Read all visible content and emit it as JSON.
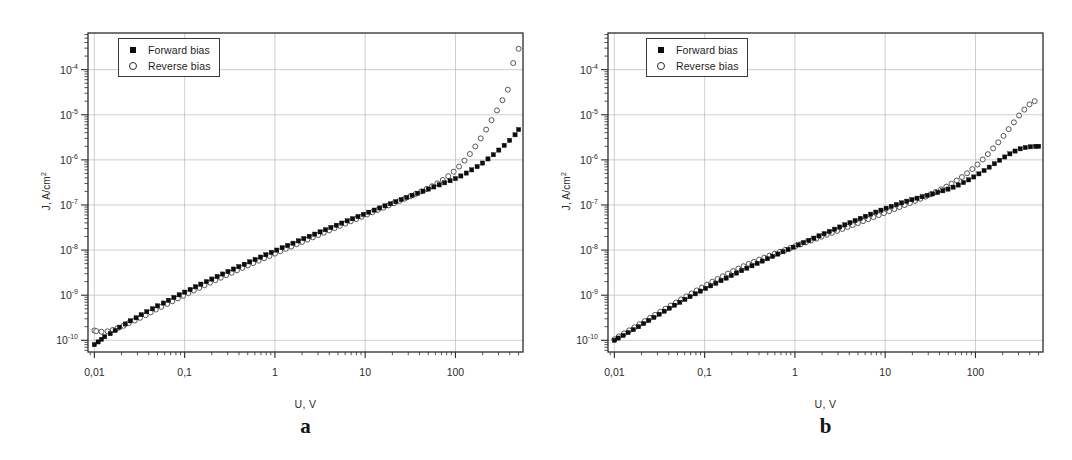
{
  "figure": {
    "background": "#ffffff",
    "axis_color": "#2b2b2b",
    "grid_color": "#b9b9b9",
    "forward_color": "#0d0d0d",
    "reverse_color": "#3a3a3a"
  },
  "panels": [
    {
      "letter": "a",
      "legend": {
        "forward_label": "Forward bias",
        "reverse_label": "Reverse bias",
        "forward_marker": "filled-square-marker",
        "reverse_marker": "open-circle-marker"
      },
      "axes": {
        "xlabel": "U, V",
        "ylabel_main": "J, A/cm",
        "ylabel_sup": "2",
        "xticks": [
          "0,01",
          "0,1",
          "1",
          "10",
          "100"
        ],
        "xtick_values": [
          0.01,
          0.1,
          1,
          10,
          100
        ],
        "yticks": [
          "10",
          "10",
          "10",
          "10",
          "10",
          "10",
          "10"
        ],
        "ytick_exponents": [
          "-4",
          "-5",
          "-6",
          "-7",
          "-8",
          "-9",
          "-10"
        ],
        "ytick_values": [
          0.0001,
          1e-05,
          1e-06,
          1e-07,
          1e-08,
          1e-09,
          1e-10
        ],
        "xlim": [
          0.0085,
          560
        ],
        "ylim": [
          5.5e-11,
          0.00065
        ],
        "xscale": "log",
        "yscale": "log",
        "grid": true
      }
    },
    {
      "letter": "b",
      "legend": {
        "forward_label": "Forward bias",
        "reverse_label": "Reverse bias",
        "forward_marker": "filled-square-marker",
        "reverse_marker": "open-circle-marker"
      },
      "axes": {
        "xlabel": "U, V",
        "ylabel_main": "J, A/cm",
        "ylabel_sup": "2",
        "xticks": [
          "0,01",
          "0,1",
          "1",
          "10",
          "100"
        ],
        "xtick_values": [
          0.01,
          0.1,
          1,
          10,
          100
        ],
        "yticks": [
          "10",
          "10",
          "10",
          "10",
          "10",
          "10",
          "10"
        ],
        "ytick_exponents": [
          "-4",
          "-5",
          "-6",
          "-7",
          "-8",
          "-9",
          "-10"
        ],
        "ytick_values": [
          0.0001,
          1e-05,
          1e-06,
          1e-07,
          1e-08,
          1e-09,
          1e-10
        ],
        "xlim": [
          0.0085,
          560
        ],
        "ylim": [
          5.5e-11,
          0.00065
        ],
        "xscale": "log",
        "yscale": "log",
        "grid": true
      }
    }
  ],
  "chart_data": [
    {
      "type": "scatter",
      "panel": "a",
      "title": "",
      "xlabel": "U, V",
      "ylabel": "J, A/cm2",
      "xscale": "log",
      "yscale": "log",
      "xlim": [
        0.0085,
        560
      ],
      "ylim": [
        5.5e-11,
        0.00065
      ],
      "grid": true,
      "legend_position": "upper-left",
      "series": [
        {
          "name": "Forward bias",
          "marker": "filled-square",
          "color": "#0d0d0d",
          "x": [
            0.01,
            0.011,
            0.012,
            0.013,
            0.015,
            0.017,
            0.019,
            0.022,
            0.025,
            0.029,
            0.033,
            0.038,
            0.044,
            0.05,
            0.058,
            0.066,
            0.076,
            0.087,
            0.1,
            0.115,
            0.132,
            0.151,
            0.174,
            0.2,
            0.229,
            0.263,
            0.302,
            0.347,
            0.398,
            0.457,
            0.525,
            0.603,
            0.692,
            0.794,
            0.912,
            1.047,
            1.202,
            1.38,
            1.585,
            1.82,
            2.089,
            2.399,
            2.754,
            3.162,
            3.631,
            4.169,
            4.786,
            5.495,
            6.31,
            7.244,
            8.318,
            9.55,
            10.96,
            12.59,
            14.45,
            16.6,
            19.05,
            21.88,
            25.12,
            28.84,
            33.11,
            38.02,
            43.65,
            50.12,
            57.54,
            66.07,
            75.86,
            87.1,
            100.0,
            114.8,
            131.8,
            151.4,
            173.8,
            199.5,
            229.1,
            263.0,
            302.0,
            346.7,
            398.1,
            457.1,
            501.2
          ],
          "y": [
            8e-11,
            9.2e-11,
            1.05e-10,
            1.2e-10,
            1.4e-10,
            1.65e-10,
            1.95e-10,
            2.3e-10,
            2.7e-10,
            3.15e-10,
            3.7e-10,
            4.3e-10,
            5e-10,
            5.8e-10,
            6.7e-10,
            7.7e-10,
            8.9e-10,
            1.02e-09,
            1.17e-09,
            1.34e-09,
            1.54e-09,
            1.76e-09,
            2e-09,
            2.28e-09,
            2.6e-09,
            2.95e-09,
            3.35e-09,
            3.8e-09,
            4.3e-09,
            4.85e-09,
            5.5e-09,
            6.2e-09,
            7e-09,
            7.9e-09,
            8.9e-09,
            1e-08,
            1.13e-08,
            1.27e-08,
            1.42e-08,
            1.6e-08,
            1.8e-08,
            2.02e-08,
            2.26e-08,
            2.53e-08,
            2.83e-08,
            3.17e-08,
            3.55e-08,
            3.97e-08,
            4.44e-08,
            4.96e-08,
            5.54e-08,
            6.19e-08,
            6.91e-08,
            7.7e-08,
            8.58e-08,
            9.56e-08,
            1.065e-07,
            1.185e-07,
            1.32e-07,
            1.47e-07,
            1.635e-07,
            1.82e-07,
            2.025e-07,
            2.255e-07,
            2.51e-07,
            2.79e-07,
            3.1e-07,
            3.45e-07,
            3.85e-07,
            4.4e-07,
            5.1e-07,
            6e-07,
            7.1e-07,
            8.5e-07,
            1.05e-06,
            1.3e-06,
            1.65e-06,
            2.1e-06,
            2.7e-06,
            3.6e-06,
            4.7e-06
          ]
        },
        {
          "name": "Reverse bias",
          "marker": "open-circle",
          "color": "#3a3a3a",
          "x": [
            0.01,
            0.0105,
            0.012,
            0.014,
            0.016,
            0.018,
            0.021,
            0.024,
            0.028,
            0.032,
            0.037,
            0.042,
            0.048,
            0.055,
            0.064,
            0.073,
            0.084,
            0.096,
            0.11,
            0.126,
            0.145,
            0.166,
            0.191,
            0.219,
            0.251,
            0.288,
            0.331,
            0.38,
            0.436,
            0.501,
            0.575,
            0.66,
            0.758,
            0.871,
            1.0,
            1.148,
            1.318,
            1.514,
            1.738,
            1.995,
            2.291,
            2.63,
            3.02,
            3.467,
            3.981,
            4.571,
            5.248,
            6.026,
            6.918,
            7.943,
            9.12,
            10.47,
            12.02,
            13.8,
            15.85,
            18.2,
            20.89,
            23.99,
            27.54,
            31.62,
            36.31,
            41.69,
            47.86,
            54.95,
            63.1,
            72.44,
            83.18,
            95.5,
            109.6,
            125.9,
            144.5,
            165.9,
            190.5,
            218.8,
            251.2,
            288.4,
            331.1,
            380.2,
            436.5,
            501.2
          ],
          "y": [
            1.65e-10,
            1.6e-10,
            1.55e-10,
            1.58e-10,
            1.7e-10,
            1.85e-10,
            2.1e-10,
            2.4e-10,
            2.75e-10,
            3.15e-10,
            3.6e-10,
            4.15e-10,
            4.8e-10,
            5.5e-10,
            6.4e-10,
            7.35e-10,
            8.45e-10,
            9.7e-10,
            1.11e-09,
            1.27e-09,
            1.45e-09,
            1.66e-09,
            1.89e-09,
            2.15e-09,
            2.44e-09,
            2.77e-09,
            3.14e-09,
            3.56e-09,
            4.03e-09,
            4.56e-09,
            5.15e-09,
            5.82e-09,
            6.57e-09,
            7.41e-09,
            8.36e-09,
            9.42e-09,
            1.062e-08,
            1.196e-08,
            1.346e-08,
            1.515e-08,
            1.705e-08,
            1.918e-08,
            2.157e-08,
            2.425e-08,
            2.726e-08,
            3.064e-08,
            3.443e-08,
            3.868e-08,
            4.345e-08,
            4.88e-08,
            5.48e-08,
            6.155e-08,
            6.91e-08,
            7.76e-08,
            8.71e-08,
            9.78e-08,
            1.098e-07,
            1.233e-07,
            1.385e-07,
            1.56e-07,
            1.76e-07,
            1.99e-07,
            2.265e-07,
            2.6e-07,
            3.02e-07,
            3.58e-07,
            4.35e-07,
            5.45e-07,
            7.1e-07,
            9.6e-07,
            1.35e-06,
            1.98e-06,
            3e-06,
            4.7e-06,
            7.6e-06,
            1.25e-05,
            2.1e-05,
            3.6e-05,
            0.00014,
            0.00029
          ]
        }
      ]
    },
    {
      "type": "scatter",
      "panel": "b",
      "title": "",
      "xlabel": "U, V",
      "ylabel": "J, A/cm2",
      "xscale": "log",
      "yscale": "log",
      "xlim": [
        0.0085,
        560
      ],
      "ylim": [
        5.5e-11,
        0.00065
      ],
      "grid": true,
      "legend_position": "upper-left",
      "series": [
        {
          "name": "Forward bias",
          "marker": "filled-square",
          "color": "#0d0d0d",
          "x": [
            0.01,
            0.011,
            0.0125,
            0.0142,
            0.0162,
            0.0185,
            0.0211,
            0.024,
            0.0274,
            0.0313,
            0.0357,
            0.0407,
            0.0464,
            0.053,
            0.0604,
            0.0689,
            0.0786,
            0.0897,
            0.1023,
            0.1167,
            0.1331,
            0.1518,
            0.1732,
            0.1976,
            0.2254,
            0.257,
            0.2932,
            0.3344,
            0.3814,
            0.4351,
            0.4962,
            0.566,
            0.6456,
            0.7364,
            0.84,
            0.958,
            1.093,
            1.246,
            1.422,
            1.622,
            1.85,
            2.11,
            2.407,
            2.745,
            3.131,
            3.571,
            4.073,
            4.646,
            5.299,
            6.045,
            6.895,
            7.865,
            8.971,
            10.23,
            11.67,
            13.31,
            15.18,
            17.32,
            19.75,
            22.53,
            25.7,
            29.31,
            33.43,
            38.13,
            43.49,
            49.6,
            56.58,
            64.54,
            73.61,
            83.96,
            95.77,
            109.2,
            124.6,
            142.1,
            162.1,
            184.9,
            210.9,
            240.5,
            274.3,
            312.9,
            356.9,
            407.1,
            464.2,
            501.2
          ],
          "y": [
            1e-10,
            1.12e-10,
            1.28e-10,
            1.48e-10,
            1.72e-10,
            2e-10,
            2.35e-10,
            2.75e-10,
            3.22e-10,
            3.78e-10,
            4.42e-10,
            5.15e-10,
            6e-10,
            6.95e-10,
            8.05e-10,
            9.3e-10,
            1.07e-09,
            1.23e-09,
            1.41e-09,
            1.61e-09,
            1.84e-09,
            2.1e-09,
            2.39e-09,
            2.72e-09,
            3.09e-09,
            3.5e-09,
            3.96e-09,
            4.48e-09,
            5.06e-09,
            5.71e-09,
            6.44e-09,
            7.25e-09,
            8.16e-09,
            9.18e-09,
            1.032e-08,
            1.16e-08,
            1.303e-08,
            1.463e-08,
            1.642e-08,
            1.842e-08,
            2.065e-08,
            2.315e-08,
            2.595e-08,
            2.905e-08,
            3.25e-08,
            3.635e-08,
            4.06e-08,
            4.53e-08,
            5.05e-08,
            5.62e-08,
            6.25e-08,
            6.94e-08,
            7.68e-08,
            8.48e-08,
            9.33e-08,
            1.022e-07,
            1.115e-07,
            1.212e-07,
            1.312e-07,
            1.415e-07,
            1.522e-07,
            1.635e-07,
            1.76e-07,
            1.9e-07,
            2.06e-07,
            2.25e-07,
            2.48e-07,
            2.77e-07,
            3.14e-07,
            3.6e-07,
            4.18e-07,
            4.9e-07,
            5.8e-07,
            6.9e-07,
            8.2e-07,
            9.8e-07,
            1.16e-06,
            1.36e-06,
            1.57e-06,
            1.76e-06,
            1.88e-06,
            1.95e-06,
            1.99e-06,
            2e-06
          ]
        },
        {
          "name": "Reverse bias",
          "marker": "open-circle",
          "color": "#3a3a3a",
          "x": [
            0.01,
            0.0112,
            0.0128,
            0.0146,
            0.0167,
            0.019,
            0.0217,
            0.0248,
            0.0283,
            0.0323,
            0.0369,
            0.0421,
            0.0481,
            0.0549,
            0.0627,
            0.0716,
            0.0817,
            0.0933,
            0.1065,
            0.1216,
            0.1389,
            0.1586,
            0.1811,
            0.2068,
            0.2361,
            0.2696,
            0.3078,
            0.3515,
            0.4014,
            0.4583,
            0.5233,
            0.5975,
            0.6822,
            0.7789,
            0.8894,
            1.015,
            1.159,
            1.324,
            1.512,
            1.726,
            1.971,
            2.251,
            2.57,
            2.934,
            3.35,
            3.825,
            4.368,
            4.987,
            5.694,
            6.502,
            7.424,
            8.477,
            9.679,
            11.05,
            12.62,
            14.41,
            16.45,
            18.79,
            21.45,
            24.49,
            27.97,
            31.93,
            36.46,
            41.63,
            47.54,
            54.28,
            61.98,
            70.77,
            80.81,
            92.27,
            105.3,
            120.3,
            137.3,
            156.8,
            179.0,
            204.4,
            233.4,
            266.5,
            304.3,
            347.4,
            396.7,
            452.9,
            501.2
          ],
          "y": [
            1.05e-10,
            1.22e-10,
            1.42e-10,
            1.66e-10,
            1.94e-10,
            2.27e-10,
            2.66e-10,
            3.12e-10,
            3.66e-10,
            4.28e-10,
            5.02e-10,
            5.88e-10,
            6.88e-10,
            8.05e-10,
            9.4e-10,
            1.095e-09,
            1.275e-09,
            1.48e-09,
            1.715e-09,
            1.985e-09,
            2.29e-09,
            2.63e-09,
            3.01e-09,
            3.43e-09,
            3.89e-09,
            4.39e-09,
            4.93e-09,
            5.51e-09,
            6.13e-09,
            6.8e-09,
            7.52e-09,
            8.3e-09,
            9.15e-09,
            1.008e-08,
            1.11e-08,
            1.222e-08,
            1.345e-08,
            1.48e-08,
            1.63e-08,
            1.795e-08,
            1.98e-08,
            2.185e-08,
            2.41e-08,
            2.66e-08,
            2.94e-08,
            3.25e-08,
            3.59e-08,
            3.97e-08,
            4.39e-08,
            4.86e-08,
            5.38e-08,
            5.96e-08,
            6.6e-08,
            7.31e-08,
            8.1e-08,
            8.98e-08,
            9.96e-08,
            1.106e-07,
            1.23e-07,
            1.372e-07,
            1.535e-07,
            1.725e-07,
            1.95e-07,
            2.22e-07,
            2.55e-07,
            2.96e-07,
            3.48e-07,
            4.15e-07,
            5.05e-07,
            6.25e-07,
            7.9e-07,
            1.02e-06,
            1.34e-06,
            1.8e-06,
            2.45e-06,
            3.4e-06,
            4.8e-06,
            6.8e-06,
            9.6e-06,
            1.3e-05,
            1.7e-05,
            2e-05
          ]
        }
      ]
    }
  ]
}
